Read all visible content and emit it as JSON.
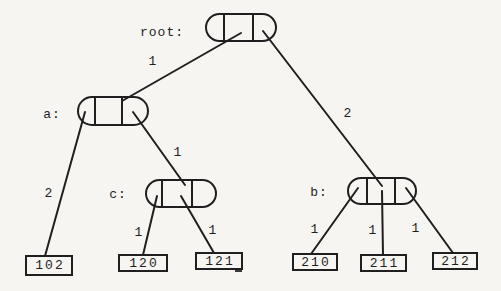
{
  "diagram": {
    "type": "trie-tree",
    "nodes": [
      {
        "id": "root",
        "label": "root:"
      },
      {
        "id": "a",
        "label": "a:"
      },
      {
        "id": "c",
        "label": "c:"
      },
      {
        "id": "b",
        "label": "b:"
      }
    ],
    "edges": [
      {
        "from": "root",
        "to": "a",
        "label": "1"
      },
      {
        "from": "root",
        "to": "b",
        "label": "2"
      },
      {
        "from": "a",
        "to": "leaf-102",
        "label": "2"
      },
      {
        "from": "a",
        "to": "c",
        "label": "1"
      },
      {
        "from": "c",
        "to": "leaf-120",
        "label": "1"
      },
      {
        "from": "c",
        "to": "leaf-121",
        "label": "1"
      },
      {
        "from": "b",
        "to": "leaf-210",
        "label": "1"
      },
      {
        "from": "b",
        "to": "leaf-211",
        "label": "1"
      },
      {
        "from": "b",
        "to": "leaf-212",
        "label": "1"
      }
    ],
    "leaves": [
      {
        "value": "102"
      },
      {
        "value": "120"
      },
      {
        "value": "121"
      },
      {
        "value": "210"
      },
      {
        "value": "211"
      },
      {
        "value": "212"
      }
    ],
    "colors": {
      "ink": "#1f1f1f",
      "paper": "#f6f5f1"
    }
  }
}
